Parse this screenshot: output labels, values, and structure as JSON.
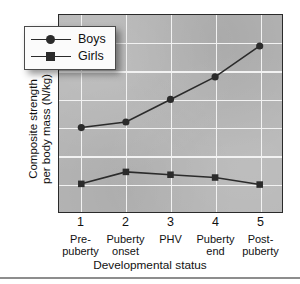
{
  "chart_data": {
    "type": "line",
    "title": "",
    "xlabel": "Developmental status",
    "ylabel_line1": "Composite strength",
    "ylabel_line2": "per body mass (N/kg)",
    "x": [
      1,
      2,
      3,
      4,
      5
    ],
    "categories": [
      "1",
      "2",
      "3",
      "4",
      "5"
    ],
    "category_names": [
      "Pre-\npuberty",
      "Puberty\nonset",
      "PHV",
      "Puberty\nend",
      "Post-\npuberty"
    ],
    "category_lines": [
      [
        "Pre-",
        "puberty"
      ],
      [
        "Puberty",
        "onset"
      ],
      [
        "PHV",
        ""
      ],
      [
        "Puberty",
        "end"
      ],
      [
        "Post-",
        "puberty"
      ]
    ],
    "series": [
      {
        "name": "Boys",
        "marker": "circle",
        "color": "#2b2b2b",
        "values": [
          24.0,
          24.4,
          26.0,
          27.6,
          29.8
        ]
      },
      {
        "name": "Girls",
        "marker": "square",
        "color": "#2b2b2b",
        "values": [
          20.0,
          20.85,
          20.65,
          20.45,
          19.95
        ]
      }
    ],
    "ylim": [
      18,
      32
    ],
    "yticks": [
      18,
      20,
      22,
      24,
      26,
      28,
      30,
      32
    ],
    "xlim": [
      0.5,
      5.5
    ],
    "grid": true,
    "legend_position": "upper left",
    "plot_background": "#b6b6b6",
    "gridline_color": "#f2f2f2",
    "axis_color": "#2a2a2a"
  },
  "legend": {
    "entries": [
      {
        "label": "Boys",
        "marker": "circle"
      },
      {
        "label": "Girls",
        "marker": "square"
      }
    ]
  }
}
